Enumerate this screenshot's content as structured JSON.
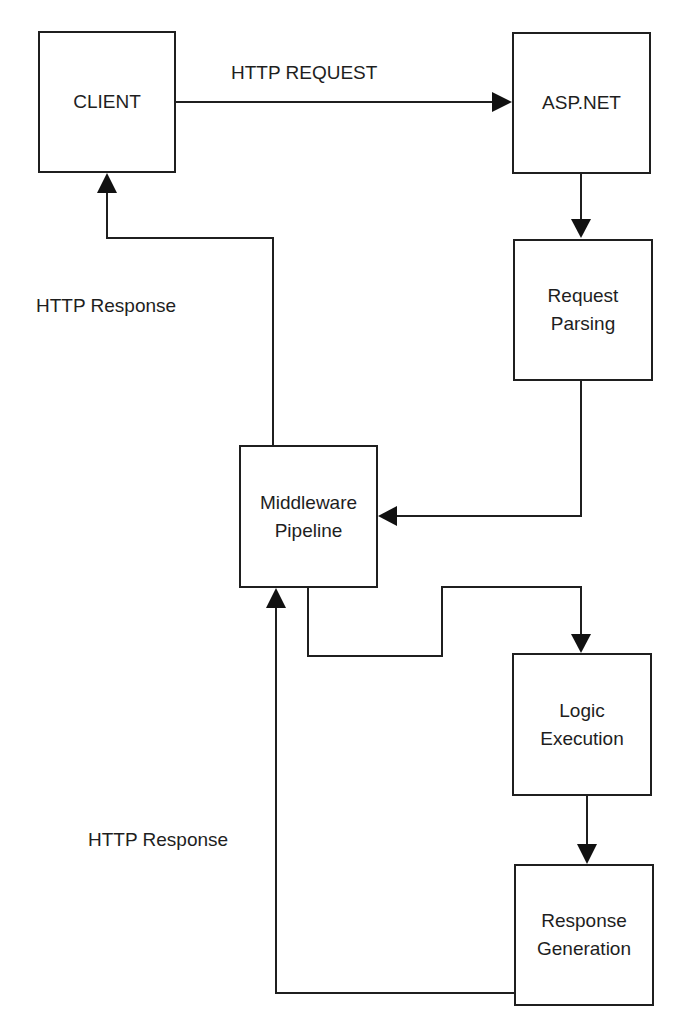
{
  "diagram": {
    "nodes": [
      {
        "id": "client",
        "label": "CLIENT"
      },
      {
        "id": "aspnet",
        "label": "ASP.NET"
      },
      {
        "id": "request-parsing",
        "label": "Request\nParsing"
      },
      {
        "id": "middleware",
        "label": "Middleware\nPipeline"
      },
      {
        "id": "logic",
        "label": "Logic\nExecution"
      },
      {
        "id": "response-generation",
        "label": "Response\nGeneration"
      }
    ],
    "edge_labels": {
      "http_request": "HTTP REQUEST",
      "http_response_top": "HTTP Response",
      "http_response_bottom": "HTTP Response"
    },
    "edges": [
      {
        "from": "client",
        "to": "aspnet",
        "label": "HTTP REQUEST"
      },
      {
        "from": "aspnet",
        "to": "request-parsing"
      },
      {
        "from": "request-parsing",
        "to": "middleware"
      },
      {
        "from": "middleware",
        "to": "logic"
      },
      {
        "from": "logic",
        "to": "response-generation"
      },
      {
        "from": "response-generation",
        "to": "middleware",
        "label": "HTTP Response"
      },
      {
        "from": "middleware",
        "to": "client",
        "label": "HTTP Response"
      }
    ],
    "colors": {
      "stroke": "#1f1f1f",
      "background": "#ffffff",
      "text": "#1e1e1e"
    }
  }
}
